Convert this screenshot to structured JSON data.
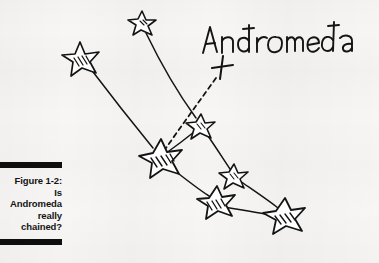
{
  "figure": {
    "caption_number": "Figure 1-2:",
    "caption_lines": [
      "Is",
      "Andromeda",
      "really",
      "chained?"
    ],
    "rule_color": "#0e0e0e",
    "ink_color": "#111111",
    "paper_color": "#f7f6f4"
  },
  "diagram": {
    "title_label": "Andromeda",
    "marker_glyph": "+",
    "marker_label": "cross-marker",
    "stars": [
      {
        "name": "star-top",
        "x": 142,
        "y": 22,
        "size": 11,
        "hatched": false
      },
      {
        "name": "star-upper-left",
        "x": 80,
        "y": 57,
        "size": 16,
        "hatched": true
      },
      {
        "name": "star-center-hub",
        "x": 200,
        "y": 125,
        "size": 11,
        "hatched": false
      },
      {
        "name": "star-left-mid",
        "x": 160,
        "y": 157,
        "size": 20,
        "hatched": true
      },
      {
        "name": "star-small-mid",
        "x": 233,
        "y": 175,
        "size": 11,
        "hatched": false
      },
      {
        "name": "star-lower-mid",
        "x": 216,
        "y": 201,
        "size": 17,
        "hatched": true
      },
      {
        "name": "star-bottom-right",
        "x": 284,
        "y": 214,
        "size": 19,
        "hatched": true
      }
    ],
    "solid_links": [
      {
        "from": "star-top",
        "to": "star-center-hub"
      },
      {
        "from": "star-upper-left",
        "to": "star-left-mid"
      },
      {
        "from": "star-center-hub",
        "to": "star-left-mid"
      },
      {
        "from": "star-center-hub",
        "to": "star-small-mid"
      },
      {
        "from": "star-left-mid",
        "to": "star-lower-mid"
      },
      {
        "from": "star-small-mid",
        "to": "star-bottom-right"
      },
      {
        "from": "star-lower-mid",
        "to": "star-bottom-right"
      }
    ],
    "dashed_links": [
      {
        "from": "star-left-mid",
        "to": "cross-marker"
      }
    ],
    "label_position": {
      "x": 200,
      "y": 47
    },
    "marker_position": {
      "x": 222,
      "y": 70
    }
  }
}
